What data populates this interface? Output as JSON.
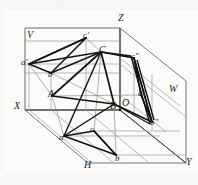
{
  "figure": {
    "kind": "descriptive-geometry-projection",
    "width": 198,
    "height": 185,
    "background_color": "#fbfbfa",
    "line_color": "#3a3a3a",
    "bold_line_color": "#111111",
    "faint_line_color": "#9a9a9a",
    "label_color": "#1c1c1c"
  },
  "axes": {
    "origin_label": "O",
    "z_label": "Z",
    "x_label": "X",
    "y_label": "Y",
    "w_label": "W",
    "v_label": "V",
    "h_label": "H"
  },
  "points": {
    "space": [
      {
        "id": "A",
        "label": "A",
        "x": 52,
        "y": 96
      },
      {
        "id": "B",
        "label": "B",
        "x": 114,
        "y": 104
      },
      {
        "id": "C",
        "label": "C",
        "x": 101,
        "y": 52
      }
    ],
    "frontal": [
      {
        "id": "a1",
        "label": "a'",
        "x": 29,
        "y": 64
      },
      {
        "id": "b1",
        "label": "b'",
        "x": 51,
        "y": 73
      },
      {
        "id": "c1",
        "label": "c'",
        "x": 86,
        "y": 38
      }
    ],
    "horizontal": [
      {
        "id": "a",
        "label": "a",
        "x": 64,
        "y": 136
      },
      {
        "id": "b",
        "label": "b",
        "x": 116,
        "y": 155
      },
      {
        "id": "c",
        "label": "c",
        "x": 94,
        "y": 131
      }
    ],
    "profile": [
      {
        "id": "a2",
        "label": "a\"",
        "x": 141,
        "y": 95
      },
      {
        "id": "b2",
        "label": "b\"",
        "x": 152,
        "y": 122
      },
      {
        "id": "c2",
        "label": "c\"",
        "x": 134,
        "y": 58
      }
    ]
  },
  "scan_artifacts": {
    "top_band": "· · · ·  · · ·· · · ·",
    "bottom_band": "· ·  · · ·  · ·"
  }
}
